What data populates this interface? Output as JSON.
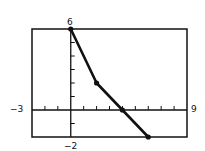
{
  "chart_data": {
    "type": "line",
    "title": "",
    "xlabel": "",
    "ylabel": "",
    "xlim": [
      -3,
      9
    ],
    "ylim": [
      -2,
      6
    ],
    "x_tick_step": 1,
    "y_tick_step": 1,
    "grid": false,
    "legend": null,
    "series": [
      {
        "name": "piecewise-linear",
        "x": [
          0,
          2,
          4,
          6
        ],
        "y": [
          6,
          2,
          0,
          -2
        ],
        "markers": true
      }
    ],
    "annotations": {
      "xmin_label": "−3",
      "xmax_label": "9",
      "ymax_label": "6",
      "ymin_label": "−2"
    }
  },
  "colors": {
    "line": "#111111",
    "frame": "#111111",
    "background": "#ffffff"
  }
}
